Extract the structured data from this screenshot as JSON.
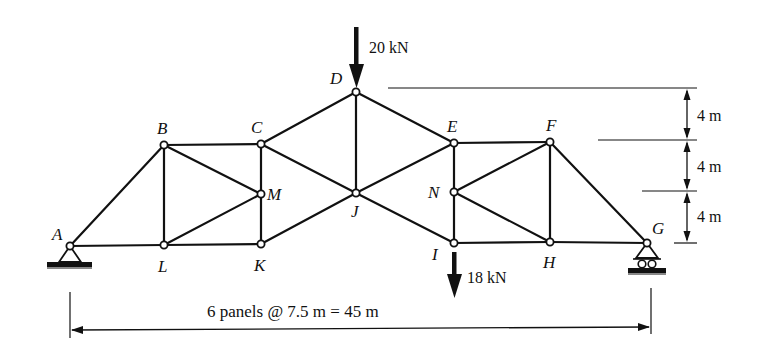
{
  "diagram": {
    "nodes": [
      {
        "id": "A",
        "x": 70,
        "y": 246,
        "lx": 52,
        "ly": 234
      },
      {
        "id": "B",
        "x": 164,
        "y": 145,
        "lx": 157,
        "ly": 133
      },
      {
        "id": "C",
        "x": 261,
        "y": 144,
        "lx": 251,
        "ly": 132
      },
      {
        "id": "D",
        "x": 356,
        "y": 92,
        "lx": 331,
        "ly": 83
      },
      {
        "id": "E",
        "x": 454,
        "y": 143,
        "lx": 447,
        "ly": 131
      },
      {
        "id": "F",
        "x": 550,
        "y": 142,
        "lx": 546,
        "ly": 130
      },
      {
        "id": "G",
        "x": 647,
        "y": 243,
        "lx": 652,
        "ly": 231
      },
      {
        "id": "H",
        "x": 550,
        "y": 242,
        "lx": 544,
        "ly": 268
      },
      {
        "id": "I",
        "x": 454,
        "y": 243,
        "lx": 430,
        "ly": 260
      },
      {
        "id": "J",
        "x": 356,
        "y": 193,
        "lx": 350,
        "ly": 218
      },
      {
        "id": "K",
        "x": 261,
        "y": 244,
        "lx": 254,
        "ly": 271
      },
      {
        "id": "L",
        "x": 164,
        "y": 245,
        "lx": 158,
        "ly": 272
      },
      {
        "id": "M",
        "x": 261,
        "y": 194,
        "lx": 268,
        "ly": 200
      },
      {
        "id": "N",
        "x": 454,
        "y": 192,
        "lx": 427,
        "ly": 198
      }
    ],
    "members": [
      [
        "A",
        "B"
      ],
      [
        "A",
        "L"
      ],
      [
        "L",
        "K"
      ],
      [
        "K",
        "J"
      ],
      [
        "J",
        "I"
      ],
      [
        "I",
        "H"
      ],
      [
        "H",
        "G"
      ],
      [
        "B",
        "C"
      ],
      [
        "C",
        "D"
      ],
      [
        "D",
        "E"
      ],
      [
        "E",
        "F"
      ],
      [
        "F",
        "G"
      ],
      [
        "B",
        "L"
      ],
      [
        "B",
        "M"
      ],
      [
        "L",
        "M"
      ],
      [
        "C",
        "M"
      ],
      [
        "M",
        "K"
      ],
      [
        "C",
        "J"
      ],
      [
        "D",
        "J"
      ],
      [
        "J",
        "E"
      ],
      [
        "E",
        "N"
      ],
      [
        "N",
        "I"
      ],
      [
        "N",
        "F"
      ],
      [
        "N",
        "H"
      ],
      [
        "F",
        "H"
      ]
    ],
    "loads": [
      {
        "node": "D",
        "label": "20 kN",
        "direction": "down"
      },
      {
        "node": "I",
        "label": "18 kN",
        "direction": "down"
      }
    ],
    "supports": [
      {
        "node": "A",
        "type": "pin"
      },
      {
        "node": "G",
        "type": "roller"
      }
    ],
    "dimensions": {
      "vertical": [
        "4 m",
        "4 m",
        "4 m"
      ],
      "horizontal": "6 panels @ 7.5 m = 45 m"
    }
  }
}
